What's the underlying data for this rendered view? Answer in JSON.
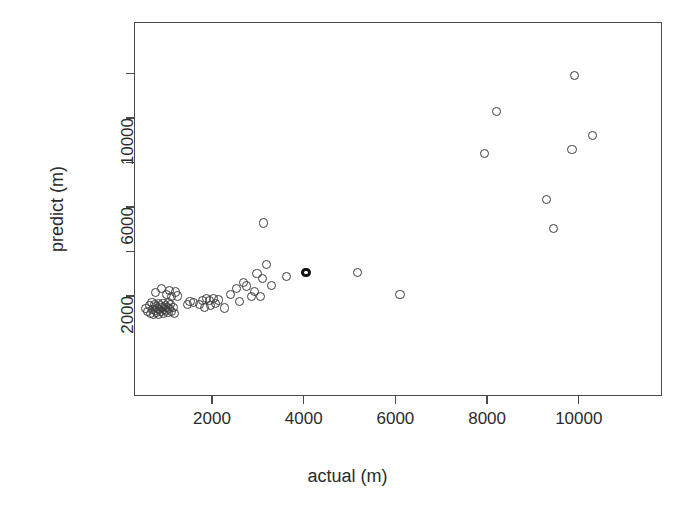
{
  "chart_data": {
    "type": "scatter",
    "title": "",
    "xlabel": "actual (m)",
    "ylabel": "predict (m)",
    "xlim": [
      260,
      11500
    ],
    "ylim": [
      900,
      12300
    ],
    "grid": false,
    "legend": null,
    "x_ticks": [
      2000,
      4000,
      6000,
      8000,
      10000
    ],
    "x_tick_labels": [
      "2000",
      "4000",
      "6000",
      "8000",
      "10000"
    ],
    "y_ticks": [
      2000,
      6000,
      10000
    ],
    "y_tick_labels": [
      "2000",
      "6000",
      "10000"
    ],
    "y_minor_ticks": [
      4000,
      8000,
      12000
    ],
    "marker": "open-circle",
    "marker_color": "#3d3d3d",
    "points": [
      {
        "x": 560,
        "y": 1450
      },
      {
        "x": 600,
        "y": 1320
      },
      {
        "x": 640,
        "y": 1560
      },
      {
        "x": 660,
        "y": 1230
      },
      {
        "x": 690,
        "y": 1700
      },
      {
        "x": 700,
        "y": 1400
      },
      {
        "x": 720,
        "y": 1180
      },
      {
        "x": 740,
        "y": 1620
      },
      {
        "x": 760,
        "y": 1350
      },
      {
        "x": 780,
        "y": 1520
      },
      {
        "x": 790,
        "y": 1260
      },
      {
        "x": 810,
        "y": 1440
      },
      {
        "x": 830,
        "y": 1660
      },
      {
        "x": 840,
        "y": 1190
      },
      {
        "x": 860,
        "y": 1380
      },
      {
        "x": 880,
        "y": 1550
      },
      {
        "x": 890,
        "y": 1290
      },
      {
        "x": 910,
        "y": 1470
      },
      {
        "x": 930,
        "y": 1640
      },
      {
        "x": 950,
        "y": 1220
      },
      {
        "x": 960,
        "y": 1410
      },
      {
        "x": 980,
        "y": 1580
      },
      {
        "x": 1000,
        "y": 1330
      },
      {
        "x": 1020,
        "y": 1500
      },
      {
        "x": 1040,
        "y": 1250
      },
      {
        "x": 1060,
        "y": 1690
      },
      {
        "x": 1080,
        "y": 1430
      },
      {
        "x": 1100,
        "y": 1600
      },
      {
        "x": 1120,
        "y": 1310
      },
      {
        "x": 1150,
        "y": 1480
      },
      {
        "x": 1180,
        "y": 1220
      },
      {
        "x": 760,
        "y": 2150
      },
      {
        "x": 900,
        "y": 2320
      },
      {
        "x": 1000,
        "y": 2050
      },
      {
        "x": 1080,
        "y": 2240
      },
      {
        "x": 1120,
        "y": 1960
      },
      {
        "x": 1200,
        "y": 2180
      },
      {
        "x": 1240,
        "y": 2000
      },
      {
        "x": 1460,
        "y": 1620
      },
      {
        "x": 1520,
        "y": 1760
      },
      {
        "x": 1600,
        "y": 1700
      },
      {
        "x": 1720,
        "y": 1620
      },
      {
        "x": 1790,
        "y": 1780
      },
      {
        "x": 1840,
        "y": 1500
      },
      {
        "x": 1880,
        "y": 1880
      },
      {
        "x": 1940,
        "y": 1800
      },
      {
        "x": 1960,
        "y": 1560
      },
      {
        "x": 2030,
        "y": 1900
      },
      {
        "x": 2080,
        "y": 1680
      },
      {
        "x": 2140,
        "y": 1820
      },
      {
        "x": 2280,
        "y": 1460
      },
      {
        "x": 2400,
        "y": 2080
      },
      {
        "x": 2540,
        "y": 2340
      },
      {
        "x": 2600,
        "y": 1740
      },
      {
        "x": 2680,
        "y": 2620
      },
      {
        "x": 2760,
        "y": 2450
      },
      {
        "x": 2860,
        "y": 1980
      },
      {
        "x": 2920,
        "y": 2220
      },
      {
        "x": 2980,
        "y": 3000
      },
      {
        "x": 3060,
        "y": 1960
      },
      {
        "x": 3100,
        "y": 2780
      },
      {
        "x": 3120,
        "y": 5280
      },
      {
        "x": 3180,
        "y": 3420
      },
      {
        "x": 3300,
        "y": 2480
      },
      {
        "x": 3620,
        "y": 2880
      },
      {
        "x": 4050,
        "y": 3050
      },
      {
        "x": 5180,
        "y": 3060
      },
      {
        "x": 6100,
        "y": 2080
      },
      {
        "x": 7950,
        "y": 8400
      },
      {
        "x": 8200,
        "y": 10300
      },
      {
        "x": 9300,
        "y": 6350
      },
      {
        "x": 9450,
        "y": 5050
      },
      {
        "x": 9850,
        "y": 8600
      },
      {
        "x": 9900,
        "y": 11900
      },
      {
        "x": 10300,
        "y": 9200
      }
    ],
    "bold_points": [
      {
        "x": 4050,
        "y": 3050
      }
    ]
  },
  "axes_geometry": {
    "plot_left": 134,
    "plot_top": 22,
    "plot_right": 662,
    "plot_bottom": 396,
    "x_pixel_per_unit": 0.04585,
    "x_pixel_origin": 120.3,
    "y_pixel_per_unit": 0.02225,
    "y_pixel_zero": 340.5
  }
}
